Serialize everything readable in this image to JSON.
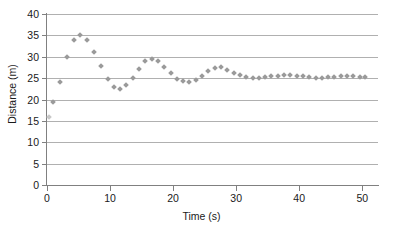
{
  "chart_data": {
    "type": "scatter",
    "title": "",
    "xlabel": "Time (s)",
    "ylabel": "Distance (m)",
    "xlim": [
      0,
      52.5
    ],
    "ylim": [
      0,
      40
    ],
    "xticks": [
      0,
      10,
      20,
      30,
      40,
      50
    ],
    "yticks": [
      0,
      5,
      10,
      15,
      20,
      25,
      30,
      35,
      40
    ],
    "grid": "horizontal",
    "legend": "none",
    "marker": "diamond",
    "marker_color": "#9a9a9a",
    "series": [
      {
        "name": "Distance vs Time",
        "x": [
          0.3,
          1.0,
          2.0,
          3.2,
          4.3,
          5.2,
          6.4,
          7.5,
          8.6,
          9.6,
          10.6,
          11.6,
          12.6,
          13.6,
          14.6,
          15.6,
          16.6,
          17.6,
          18.6,
          19.6,
          20.6,
          21.6,
          22.6,
          23.6,
          24.6,
          25.6,
          26.6,
          27.6,
          28.6,
          29.6,
          30.6,
          31.6,
          32.6,
          33.6,
          34.6,
          35.6,
          36.6,
          37.6,
          38.6,
          39.6,
          40.6,
          41.6,
          42.6,
          43.6,
          44.6,
          45.6,
          46.6,
          47.6,
          48.6,
          49.6,
          50.4
        ],
        "y": [
          16.0,
          19.5,
          24.0,
          30.0,
          34.0,
          35.1,
          34.0,
          31.2,
          27.8,
          24.9,
          23.0,
          22.4,
          23.3,
          25.1,
          27.2,
          29.0,
          29.4,
          29.0,
          27.7,
          26.1,
          24.9,
          24.3,
          24.2,
          24.6,
          25.6,
          26.6,
          27.3,
          27.5,
          27.0,
          26.3,
          25.7,
          25.3,
          25.1,
          25.0,
          25.2,
          25.4,
          25.6,
          25.7,
          25.7,
          25.6,
          25.4,
          25.2,
          25.1,
          25.1,
          25.2,
          25.3,
          25.4,
          25.4,
          25.4,
          25.3,
          25.2
        ]
      }
    ]
  }
}
